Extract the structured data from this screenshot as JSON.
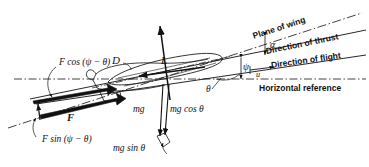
{
  "figure": {
    "background": "#ffffff",
    "ink": "#111111"
  },
  "reference_lines": [
    {
      "id": "plane-of-wing",
      "label": "Plane of wing",
      "style": "dash-dot"
    },
    {
      "id": "direction-of-thrust",
      "label": "Direction of thrust",
      "style": "solid"
    },
    {
      "id": "direction-of-flight",
      "label": "Direction of flight",
      "style": "solid"
    },
    {
      "id": "horizontal-reference",
      "label": "Horizontal reference",
      "style": "dash-dot"
    }
  ],
  "angles": [
    {
      "id": "alpha",
      "symbol": "α",
      "between": "Direction of thrust and Direction of flight"
    },
    {
      "id": "psi",
      "symbol": "ψ",
      "between": "Direction of thrust and Horizontal reference"
    },
    {
      "id": "theta",
      "symbol": "θ",
      "between": "Direction of flight and Horizontal reference"
    }
  ],
  "forces": [
    {
      "id": "lift",
      "symbol": "L",
      "direction": "up, perpendicular to wing"
    },
    {
      "id": "drag",
      "symbol": "D",
      "direction": "rearward along flight path"
    },
    {
      "id": "thrust",
      "symbol": "F",
      "direction": "forward along thrust line"
    },
    {
      "id": "weight",
      "symbol": "mg",
      "direction": "vertically down"
    },
    {
      "id": "mg-cos-theta",
      "symbol": "mg cos θ",
      "direction": "component normal to flight path"
    },
    {
      "id": "mg-sin-theta",
      "symbol": "mg sin θ",
      "direction": "component along flight path"
    },
    {
      "id": "f-cos",
      "symbol": "F cos (ψ − θ)",
      "direction": "thrust component along flight path"
    },
    {
      "id": "f-sin",
      "symbol": "F sin (ψ − θ)",
      "direction": "thrust component normal to flight path"
    }
  ],
  "velocity": {
    "symbol": "u",
    "description": "free-stream velocity along flight direction"
  },
  "labels": {
    "plane_of_wing": "Plane of wing",
    "direction_of_thrust": "Direction of thrust",
    "direction_of_flight": "Direction of flight",
    "horizontal_reference": "Horizontal reference",
    "alpha": "α",
    "psi": "ψ",
    "theta": "θ",
    "u": "u",
    "L": "L",
    "D": "D",
    "F": "F",
    "mg": "mg",
    "mg_cos_theta": "mg cos θ",
    "mg_sin_theta": "mg sin θ",
    "f_cos": "F cos (ψ − θ)",
    "f_sin": "F sin (ψ − θ)"
  }
}
